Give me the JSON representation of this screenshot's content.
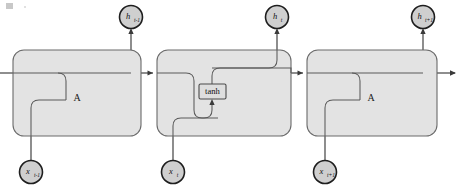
{
  "figure": {
    "cell_label": "A",
    "operation_label": "tanh",
    "colors": {
      "cell_fill": "#e3e3e3",
      "cell_stroke": "#6b6b6b",
      "node_fill": "#cfcfcf",
      "node_stroke": "#1e1e1e",
      "wire": "#3a3a3a",
      "background": "#ffffff"
    }
  },
  "outputs": [
    {
      "id": "h-prev",
      "base": "h",
      "sub": "t-1"
    },
    {
      "id": "h-curr",
      "base": "h",
      "sub": "t"
    },
    {
      "id": "h-next",
      "base": "h",
      "sub": "t+1"
    }
  ],
  "inputs": [
    {
      "id": "x-prev",
      "base": "x",
      "sub": "t-1"
    },
    {
      "id": "x-curr",
      "base": "x",
      "sub": "t"
    },
    {
      "id": "x-next",
      "base": "x",
      "sub": "t+1"
    }
  ],
  "cells": [
    {
      "id": "cell-prev",
      "label": "A",
      "expanded": false
    },
    {
      "id": "cell-curr",
      "label": "",
      "expanded": true,
      "operation": "tanh"
    },
    {
      "id": "cell-next",
      "label": "A",
      "expanded": false
    }
  ]
}
